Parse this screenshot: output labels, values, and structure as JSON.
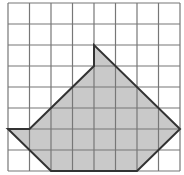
{
  "diagram": {
    "grid": {
      "columns": 8,
      "rows": 8
    },
    "polygon": {
      "vertices_grid_units": [
        [
          4,
          2
        ],
        [
          4,
          3
        ],
        [
          1,
          6
        ],
        [
          0,
          6
        ],
        [
          2,
          8
        ],
        [
          6,
          8
        ],
        [
          8,
          6
        ]
      ],
      "fill": "#c9c9c9",
      "stroke": "#333333"
    },
    "colors": {
      "grid_line": "#777777",
      "background": "#ffffff"
    }
  }
}
